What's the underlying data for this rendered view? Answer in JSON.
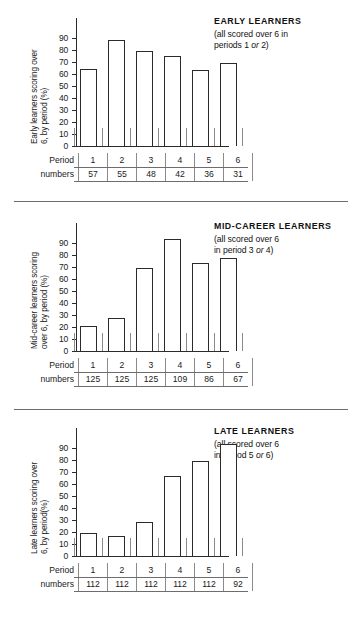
{
  "figure": {
    "row_labels": [
      "Period",
      "numbers"
    ],
    "y_ticks": [
      "90",
      "80",
      "70",
      "60",
      "50",
      "40",
      "30",
      "20",
      "10",
      "0"
    ]
  },
  "chart_data": [
    {
      "type": "bar",
      "title": "EARLY LEARNERS",
      "subtitle_line1": "(all scored over 6 in",
      "subtitle_pre": "periods 1 ",
      "subtitle_em": "or",
      "subtitle_post": " 2)",
      "ylabel": "Early learners scoring over 6, by period (%)",
      "ylabel_line1": "Early learners scoring over",
      "ylabel_line2": "6, by period (%)",
      "xlabel": "Period numbers",
      "categories": [
        "1",
        "2",
        "3",
        "4",
        "5",
        "6"
      ],
      "values": [
        64,
        88,
        79,
        75,
        63,
        69
      ],
      "counts": [
        57,
        55,
        48,
        42,
        36,
        31
      ],
      "ylim": [
        0,
        95
      ],
      "grid": false,
      "legend": "none"
    },
    {
      "type": "bar",
      "title": "MID-CAREER LEARNERS",
      "subtitle_line1": "(all scored over 6",
      "subtitle_pre": "in period 3 ",
      "subtitle_em": "or",
      "subtitle_post": " 4)",
      "ylabel": "Mid-career learners scoring over 6, by period (%)",
      "ylabel_line1": "Mid-career learners scoring",
      "ylabel_line2": "over 6, by period (%)",
      "xlabel": "Period numbers",
      "categories": [
        "1",
        "2",
        "3",
        "4",
        "5",
        "6"
      ],
      "values": [
        21,
        27,
        69,
        93,
        73,
        77
      ],
      "counts": [
        125,
        125,
        125,
        109,
        86,
        67
      ],
      "ylim": [
        0,
        95
      ],
      "grid": false,
      "legend": "none"
    },
    {
      "type": "bar",
      "title": "LATE LEARNERS",
      "subtitle_line1": "(all scored over 6",
      "subtitle_pre": "in period 5 ",
      "subtitle_em": "or",
      "subtitle_post": " 6)",
      "ylabel": "Late learners scoring over 6, by period(%)",
      "ylabel_line1": "Late learners scoring over",
      "ylabel_line2": "6, by period(%)",
      "xlabel": "Period numbers",
      "categories": [
        "1",
        "2",
        "3",
        "4",
        "5",
        "6"
      ],
      "values": [
        19,
        17,
        28,
        66,
        79,
        93
      ],
      "counts": [
        112,
        112,
        112,
        112,
        112,
        92
      ],
      "ylim": [
        0,
        95
      ],
      "grid": false,
      "legend": "none"
    }
  ]
}
